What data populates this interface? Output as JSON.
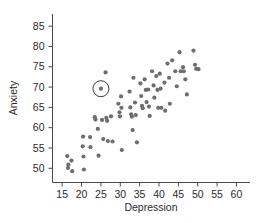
{
  "chart_data": {
    "type": "scatter",
    "title": "",
    "xlabel": "Depression",
    "ylabel": "Anxiety",
    "xlim": [
      12.5,
      63.5
    ],
    "ylim": [
      46.5,
      88.0
    ],
    "xticks": [
      15,
      20,
      25,
      30,
      35,
      40,
      45,
      50,
      55,
      60
    ],
    "yticks": [
      50,
      55,
      60,
      65,
      70,
      75,
      80,
      85
    ],
    "xtick_labels": [
      "15",
      "20",
      "25",
      "30",
      "35",
      "40",
      "45",
      "50",
      "55",
      "60"
    ],
    "ytick_labels": [
      "50",
      "55",
      "60",
      "65",
      "70",
      "75",
      "80",
      "85"
    ],
    "grid": false,
    "legend": null,
    "point_color": "#6e6e6e",
    "point_size": 2.1,
    "highlight_color": "#3c3c3c",
    "axis_color": "#4a4a4a",
    "annotations": [
      {
        "name": "circled-outlier",
        "shape": "circle",
        "x": 25.0,
        "y": 69.6,
        "radius_px": 8
      }
    ],
    "points": [
      [
        16.3,
        53.0
      ],
      [
        16.6,
        50.9
      ],
      [
        16.5,
        50.1
      ],
      [
        17.4,
        51.9
      ],
      [
        17.6,
        49.3
      ],
      [
        20.4,
        57.8
      ],
      [
        20.3,
        55.4
      ],
      [
        20.5,
        52.9
      ],
      [
        20.6,
        49.7
      ],
      [
        22.2,
        57.7
      ],
      [
        22.3,
        55.2
      ],
      [
        23.4,
        62.6
      ],
      [
        23.6,
        62.0
      ],
      [
        24.2,
        59.7
      ],
      [
        24.4,
        53.1
      ],
      [
        25.0,
        69.6
      ],
      [
        25.3,
        61.9
      ],
      [
        25.6,
        57.2
      ],
      [
        26.2,
        73.6
      ],
      [
        26.4,
        62.4
      ],
      [
        26.6,
        61.7
      ],
      [
        26.8,
        56.7
      ],
      [
        27.6,
        62.8
      ],
      [
        28.0,
        56.6
      ],
      [
        29.5,
        65.9
      ],
      [
        29.8,
        63.8
      ],
      [
        29.9,
        62.8
      ],
      [
        30.2,
        67.7
      ],
      [
        30.3,
        64.9
      ],
      [
        30.4,
        54.5
      ],
      [
        32.4,
        68.9
      ],
      [
        32.6,
        65.0
      ],
      [
        32.8,
        63.3
      ],
      [
        33.0,
        62.7
      ],
      [
        33.2,
        59.4
      ],
      [
        33.4,
        72.3
      ],
      [
        33.8,
        66.2
      ],
      [
        34.0,
        63.1
      ],
      [
        34.3,
        56.4
      ],
      [
        35.2,
        70.9
      ],
      [
        35.4,
        67.8
      ],
      [
        35.6,
        65.4
      ],
      [
        35.8,
        64.8
      ],
      [
        36.3,
        71.9
      ],
      [
        36.6,
        69.3
      ],
      [
        36.8,
        66.3
      ],
      [
        37.2,
        69.4
      ],
      [
        37.4,
        65.2
      ],
      [
        37.6,
        62.9
      ],
      [
        38.2,
        73.9
      ],
      [
        38.6,
        70.4
      ],
      [
        38.8,
        67.4
      ],
      [
        39.3,
        72.7
      ],
      [
        39.6,
        69.3
      ],
      [
        39.8,
        64.9
      ],
      [
        40.2,
        73.3
      ],
      [
        40.4,
        69.6
      ],
      [
        40.6,
        64.9
      ],
      [
        41.4,
        71.1
      ],
      [
        41.6,
        64.2
      ],
      [
        42.2,
        75.8
      ],
      [
        42.6,
        72.3
      ],
      [
        42.8,
        65.9
      ],
      [
        43.4,
        76.6
      ],
      [
        44.2,
        73.9
      ],
      [
        44.6,
        70.2
      ],
      [
        45.3,
        78.6
      ],
      [
        45.6,
        73.9
      ],
      [
        46.2,
        74.9
      ],
      [
        46.4,
        73.9
      ],
      [
        46.8,
        71.9
      ],
      [
        47.2,
        68.2
      ],
      [
        48.9,
        79.0
      ],
      [
        49.3,
        75.5
      ],
      [
        49.6,
        74.5
      ],
      [
        50.2,
        74.4
      ]
    ]
  },
  "axes": {
    "x_title": "Depression",
    "y_title": "Anxiety"
  }
}
